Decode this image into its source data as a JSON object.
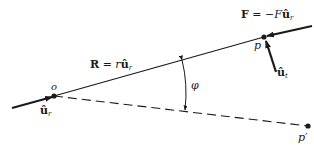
{
  "diagram": {
    "title": "",
    "points": {
      "o": {
        "label": "o",
        "x": 54,
        "y": 96
      },
      "p": {
        "label": "p",
        "x": 264,
        "y": 37
      },
      "p_prime": {
        "label": "p′",
        "x": 308,
        "y": 126
      }
    },
    "labels": {
      "position_vector": {
        "bold": "R",
        "rest": " = r",
        "unit": "û",
        "sub": "r"
      },
      "force": {
        "bold": "F",
        "rest": " = −F",
        "unit": "û",
        "sub": "r"
      },
      "unit_r_left": {
        "unit": "û",
        "sub": "r"
      },
      "unit_t": {
        "unit": "û",
        "sub": "t"
      },
      "angle": "φ"
    },
    "colors": {
      "ink": "#1a1a1a",
      "background": "#ffffff"
    }
  }
}
